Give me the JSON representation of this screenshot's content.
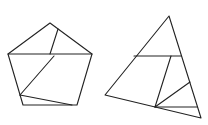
{
  "figure": {
    "width": 208,
    "height": 125,
    "stroke_color": "#222222",
    "background": "#ffffff",
    "shapes": [
      {
        "name": "pentagon-dissection",
        "outline": "50,23 92,54 77,105 23,105 8,54",
        "cuts": [
          {
            "x1": 8,
            "y1": 54,
            "x2": 92,
            "y2": 54
          },
          {
            "x1": 58,
            "y1": 29,
            "x2": 50,
            "y2": 54
          },
          {
            "x1": 54,
            "y1": 56,
            "x2": 20,
            "y2": 95
          },
          {
            "x1": 20,
            "y1": 95,
            "x2": 72,
            "y2": 105
          }
        ]
      },
      {
        "name": "triangle-dissection",
        "outline": "169,16 201,118 105,95",
        "cuts": [
          {
            "x1": 134,
            "y1": 56,
            "x2": 181,
            "y2": 56
          },
          {
            "x1": 171,
            "y1": 56,
            "x2": 155,
            "y2": 107
          },
          {
            "x1": 155,
            "y1": 107,
            "x2": 190,
            "y2": 82
          },
          {
            "x1": 155,
            "y1": 107,
            "x2": 197,
            "y2": 107
          }
        ]
      }
    ]
  }
}
